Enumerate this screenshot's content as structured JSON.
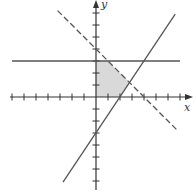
{
  "chart_data": {
    "type": "line",
    "title": "",
    "xlabel": "x",
    "ylabel": "y",
    "xlim": [
      -7,
      7
    ],
    "ylim": [
      -7,
      5
    ],
    "grid": false,
    "tick_spacing": 1,
    "lines": [
      {
        "name": "y = 3",
        "style": "solid",
        "equation": "y = 3",
        "from": [
          -7,
          3
        ],
        "to": [
          7,
          3
        ]
      },
      {
        "name": "x + y = 4",
        "style": "dashed",
        "equation": "x + y = 4",
        "from": [
          -3.2,
          7.2
        ],
        "to": [
          6.8,
          -2.8
        ]
      },
      {
        "name": "y = 1.5x - 3",
        "style": "solid",
        "equation": "y = 1.5x - 3",
        "from": [
          -2.75,
          -7.1
        ],
        "to": [
          6.6,
          6.9
        ]
      }
    ],
    "shaded_region": {
      "fill": "#d9d9d9",
      "vertices": [
        [
          0,
          0
        ],
        [
          2,
          0
        ],
        [
          2.8,
          1.2
        ],
        [
          1,
          3
        ],
        [
          0,
          3
        ]
      ]
    }
  },
  "axes": {
    "x_label": "x",
    "y_label": "y",
    "color": "#333333"
  }
}
